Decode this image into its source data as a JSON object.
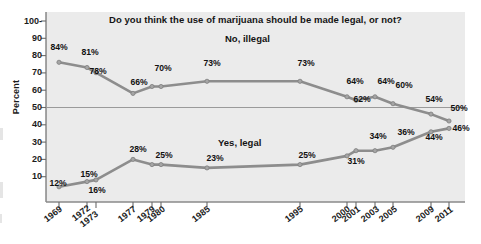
{
  "chart_data": {
    "type": "line",
    "title": "Do you think the use of marijuana should be made legal, or not?",
    "xlabel": "",
    "ylabel": "Percent",
    "ylim": [
      0,
      100
    ],
    "yticks": [
      10,
      20,
      30,
      40,
      50,
      60,
      70,
      80,
      90,
      100
    ],
    "ytick_labels": [
      "10",
      "20",
      "30",
      "40",
      "50",
      "60",
      "70",
      "80",
      "90",
      "100-"
    ],
    "grid": false,
    "reference_line": 50,
    "legend_position": "inline-labels",
    "x": [
      1969,
      1972,
      1973,
      1977,
      1979,
      1980,
      1985,
      1995,
      2000,
      2001,
      2003,
      2005,
      2009,
      2011
    ],
    "categories": [
      "1969",
      "1972",
      "1973",
      "1977",
      "1979",
      "1980",
      "1985",
      "1995",
      "2000",
      "2001",
      "2003",
      "2005",
      "2009",
      "2011"
    ],
    "series": [
      {
        "name": "No, illegal",
        "color": "#8d8d8d",
        "values": [
          84,
          81,
          78,
          66,
          70,
          70,
          73,
          73,
          64,
          62,
          64,
          60,
          54,
          50
        ],
        "labels": [
          "84%",
          "81%",
          "78%",
          "66%",
          "70%",
          "",
          "73%",
          "73%",
          "64%",
          "62%",
          "64%",
          "60%",
          "54%",
          "50%"
        ]
      },
      {
        "name": "Yes, legal",
        "color": "#8d8d8d",
        "values": [
          12,
          15,
          16,
          28,
          25,
          25,
          23,
          25,
          31,
          34,
          34,
          36,
          44,
          46
        ],
        "labels": [
          "12%",
          "15%",
          "16%",
          "28%",
          "25%",
          "",
          "23%",
          "25%",
          "31%",
          "34%",
          "",
          "36%",
          "44%",
          "46%"
        ]
      }
    ]
  },
  "axis": {
    "y_title": "Percent",
    "y_tick_labels": [
      "100-",
      "90",
      "80",
      "70",
      "60",
      "50",
      "40",
      "30",
      "20",
      "10"
    ],
    "x_tick_labels": [
      "1969",
      "1972",
      "1973",
      "1977",
      "1979",
      "1980",
      "1985",
      "1995",
      "2000",
      "2001",
      "2003",
      "2005",
      "2009",
      "2011"
    ]
  },
  "annotations": {
    "series_no_label": "No, illegal",
    "series_yes_label": "Yes, legal",
    "no_point_labels": [
      {
        "text": "84%",
        "x": 59,
        "y": 47
      },
      {
        "text": "81%",
        "x": 90,
        "y": 52
      },
      {
        "text": "78%",
        "x": 98,
        "y": 71
      },
      {
        "text": "66%",
        "x": 139,
        "y": 82
      },
      {
        "text": "70%",
        "x": 163,
        "y": 68
      },
      {
        "text": "73%",
        "x": 212,
        "y": 63
      },
      {
        "text": "73%",
        "x": 306,
        "y": 63
      },
      {
        "text": "64%",
        "x": 355,
        "y": 81
      },
      {
        "text": "62%",
        "x": 362,
        "y": 99
      },
      {
        "text": "64%",
        "x": 386,
        "y": 81
      },
      {
        "text": "60%",
        "x": 404,
        "y": 85
      },
      {
        "text": "54%",
        "x": 434,
        "y": 99
      },
      {
        "text": "50%",
        "x": 459,
        "y": 108
      }
    ],
    "yes_point_labels": [
      {
        "text": "12%",
        "x": 58,
        "y": 183
      },
      {
        "text": "15%",
        "x": 89,
        "y": 174
      },
      {
        "text": "16%",
        "x": 97,
        "y": 190
      },
      {
        "text": "28%",
        "x": 138,
        "y": 149
      },
      {
        "text": "25%",
        "x": 164,
        "y": 155
      },
      {
        "text": "23%",
        "x": 215,
        "y": 158
      },
      {
        "text": "25%",
        "x": 307,
        "y": 155
      },
      {
        "text": "31%",
        "x": 356,
        "y": 161
      },
      {
        "text": "34%",
        "x": 378,
        "y": 136
      },
      {
        "text": "36%",
        "x": 406,
        "y": 132
      },
      {
        "text": "44%",
        "x": 434,
        "y": 137
      },
      {
        "text": "46%",
        "x": 461,
        "y": 128
      }
    ]
  },
  "colors": {
    "plot_background": "#ebebeb",
    "line": "#8d8d8d",
    "axis": "#6b6b6b",
    "reference_line": "#9a9a9a",
    "text": "#141414"
  }
}
